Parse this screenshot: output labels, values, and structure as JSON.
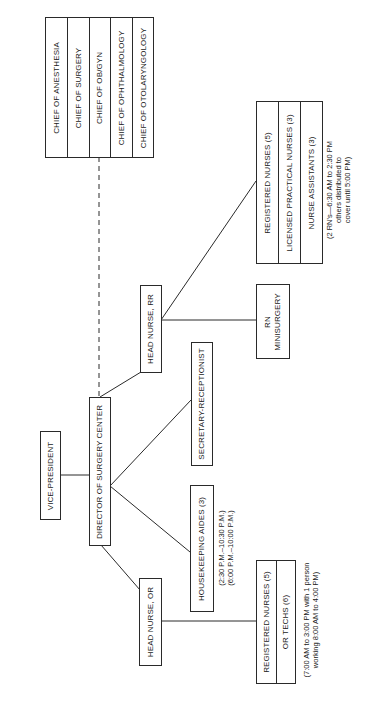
{
  "chart": {
    "vice_president": "VICE-PRESIDENT",
    "director": "DIRECTOR OF SURGERY CENTER",
    "chiefs": [
      "CHIEF OF ANESTHESIA",
      "CHIEF OF SURGERY",
      "CHIEF OF OB/GYN",
      "CHIEF OF OPHTHALMOLOGY",
      "CHIEF OF OTOLARYNGOLOGY"
    ],
    "head_nurse_rr": "HEAD NURSE, RR",
    "rr_staff": [
      "REGISTERED NURSES (5)",
      "LICENSED PRACTICAL NURSES (3)",
      "NURSE ASSISTANTS (3)"
    ],
    "rr_note": [
      "(2 RN's—6:30 AM to 2:30 PM",
      "others distributed to",
      "cover until 5:00 PM)"
    ],
    "rn_minisurgery": [
      "RN",
      "MINISURGERY"
    ],
    "secretary": "SECRETARY-RECEPTIONIST",
    "housekeeping": "HOUSEKEEPING AIDES (3)",
    "housekeeping_note": [
      "(2:30 P.M.–10:30 P.M.)",
      "(6:00 P.M.–10:00 P.M.)"
    ],
    "head_nurse_or": "HEAD NURSE, OR",
    "or_staff": [
      "REGISTERED NURSES (5)",
      "OR TECHS (6)"
    ],
    "or_note": [
      "(7:00 AM to 3:00 PM with 1 person",
      "working 8:00 AM to 4:00 PM)"
    ]
  }
}
